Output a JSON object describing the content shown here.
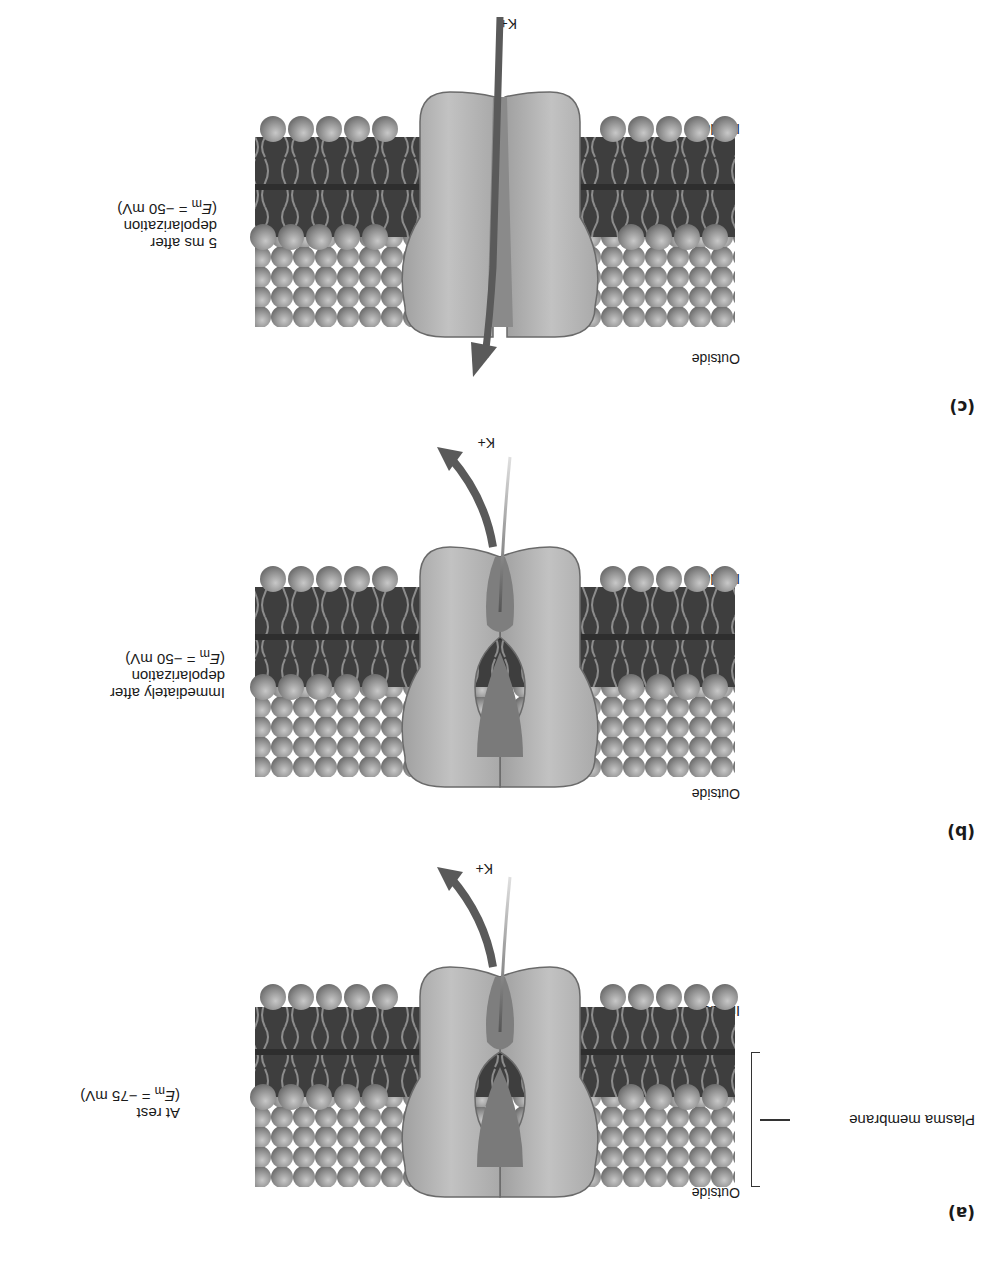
{
  "figure": {
    "orientation": "rotated 180 degrees",
    "colors": {
      "background": "#ffffff",
      "lipid_head": "#8f8f8f",
      "lipid_core": "#3d3d3d",
      "lipid_tail": "#9a9a9a",
      "channel_body": "#b9b9b9",
      "channel_edge": "#6a6a6a",
      "arrow": "#5a5a5a",
      "text": "#1a1a1a"
    },
    "shared_labels": {
      "outside": "Outside",
      "inside": "Inside",
      "ion": "K+",
      "gate_symbol": "n",
      "gate_word": "gate"
    },
    "plasma_membrane_label": "Plasma membrane",
    "panels": [
      {
        "letter": "(a)",
        "caption_line1": "At rest",
        "caption_line2": "",
        "potential_symbol": "E",
        "potential_subscript": "m",
        "potential_value": " = −75 mV)",
        "gate_state": "closed",
        "k_flow": "blocked at gate"
      },
      {
        "letter": "(b)",
        "caption_line1": "Immediately after",
        "caption_line2": "depolarization",
        "potential_symbol": "E",
        "potential_subscript": "m",
        "potential_value": " = −50 mV)",
        "gate_state": "closed",
        "k_flow": "blocked at gate"
      },
      {
        "letter": "(c)",
        "caption_line1": "5 ms after",
        "caption_line2": "depolarization",
        "potential_symbol": "E",
        "potential_subscript": "m",
        "potential_value": " = −50 mV)",
        "gate_state": "open",
        "k_flow": "passes through channel to outside"
      }
    ]
  }
}
